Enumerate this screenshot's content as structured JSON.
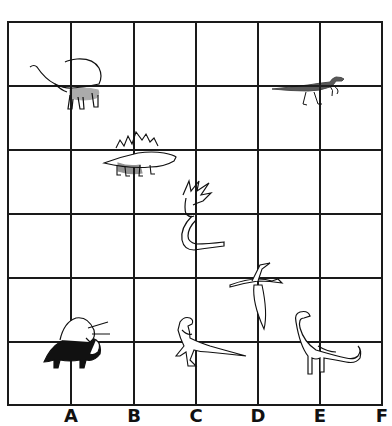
{
  "worksheet": {
    "grid": {
      "columns": 6,
      "rows": 6,
      "left": 8,
      "top": 22,
      "right": 382,
      "bottom": 405,
      "line_color": "#1a1a1a"
    },
    "column_labels": [
      "A",
      "B",
      "C",
      "D",
      "E",
      "F"
    ],
    "dinosaurs": [
      {
        "name": "sauropod-long-neck",
        "column": "A",
        "row_line": 1
      },
      {
        "name": "raptor",
        "column": "E",
        "row_line": 1
      },
      {
        "name": "stegosaurus",
        "column": "B",
        "row_line": 2
      },
      {
        "name": "plesiosaur",
        "column": "C",
        "row_line": 3
      },
      {
        "name": "pterodactyl",
        "column": "D",
        "row_line": 4
      },
      {
        "name": "triceratops",
        "column": "A",
        "row_line": 5
      },
      {
        "name": "theropod",
        "column": "C",
        "row_line": 5
      },
      {
        "name": "brachiosaurus",
        "column": "E",
        "row_line": 5
      }
    ]
  }
}
